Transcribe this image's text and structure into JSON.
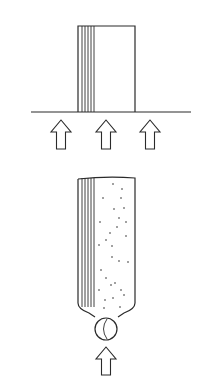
{
  "diagram": {
    "width": 204,
    "height": 386,
    "stroke_color": "#2a2a2a",
    "background": "#ffffff",
    "top_panel": {
      "description": "Flat layered block resting on a horizontal surface with three upward arrows beneath",
      "baseline": {
        "x1": 31,
        "x2": 191,
        "y": 112
      },
      "block": {
        "x": 78,
        "y": 26,
        "width": 57,
        "height": 86
      },
      "layer_lines_x": [
        82,
        85,
        88,
        91,
        94
      ],
      "arrows": [
        {
          "cx": 61,
          "tip_y": 120,
          "bottom_y": 149
        },
        {
          "cx": 106,
          "tip_y": 120,
          "bottom_y": 149
        },
        {
          "cx": 150,
          "tip_y": 120,
          "bottom_y": 149
        }
      ]
    },
    "bottom_panel": {
      "description": "Layered container filled with dots, tapering to a neck with a ball (valve) below and one upward arrow",
      "container": {
        "left": 78,
        "right": 135,
        "top": 177,
        "wall_bottom": 303,
        "neck_left": 95,
        "neck_right": 118,
        "neck_y": 317
      },
      "layer_lines_x": [
        82,
        85,
        88,
        91,
        94
      ],
      "ball": {
        "cx": 106,
        "cy": 329,
        "r": 11
      },
      "arrow": {
        "cx": 106,
        "tip_y": 347,
        "bottom_y": 375
      },
      "dots": [
        [
          113,
          184
        ],
        [
          122,
          189
        ],
        [
          103,
          198
        ],
        [
          121,
          198
        ],
        [
          114,
          209
        ],
        [
          124,
          208
        ],
        [
          100,
          222
        ],
        [
          119,
          218
        ],
        [
          126,
          222
        ],
        [
          110,
          233
        ],
        [
          117,
          227
        ],
        [
          126,
          236
        ],
        [
          106,
          240
        ],
        [
          112,
          246
        ],
        [
          99,
          245
        ],
        [
          112,
          257
        ],
        [
          119,
          261
        ],
        [
          101,
          270
        ],
        [
          128,
          262
        ],
        [
          106,
          278
        ],
        [
          111,
          285
        ],
        [
          99,
          290
        ],
        [
          115,
          283
        ],
        [
          121,
          290
        ],
        [
          105,
          300
        ],
        [
          113,
          298
        ],
        [
          124,
          295
        ],
        [
          104,
          308
        ],
        [
          120,
          307
        ]
      ]
    }
  }
}
